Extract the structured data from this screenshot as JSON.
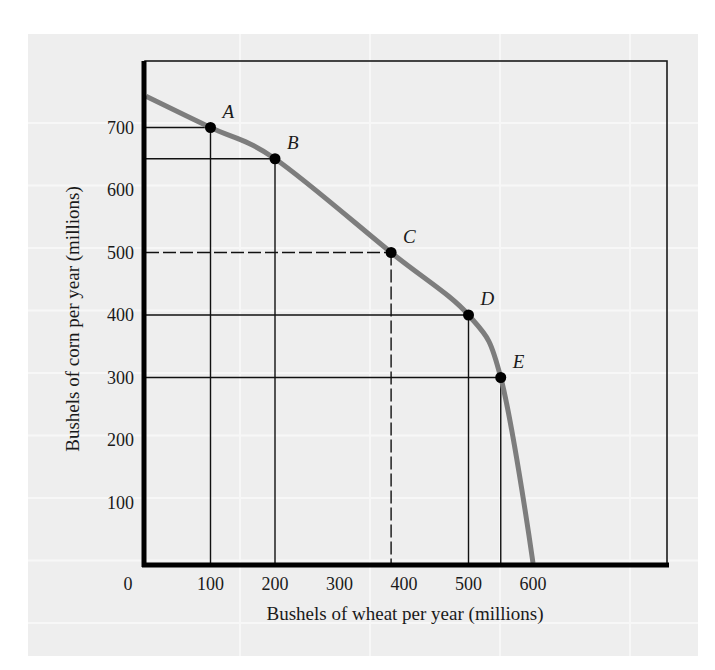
{
  "chart_data": {
    "type": "line",
    "title": "",
    "subtitle": "",
    "xlabel": "Bushels of wheat per year (millions)",
    "ylabel": "Bushels of corn per year (millions)",
    "xlim": [
      0,
      800
    ],
    "ylim": [
      0,
      800
    ],
    "grid": false,
    "legend": null,
    "x_ticks": [
      0,
      100,
      200,
      300,
      400,
      500,
      600
    ],
    "y_ticks": [
      100,
      200,
      300,
      400,
      500,
      600,
      700
    ],
    "series": [
      {
        "name": "Production possibility frontier",
        "x": [
          0,
          100,
          200,
          380,
          500,
          550,
          600
        ],
        "y": [
          750,
          700,
          650,
          500,
          400,
          300,
          0
        ]
      }
    ],
    "points": [
      {
        "label": "A",
        "x": 100,
        "y": 700,
        "guide": "solid"
      },
      {
        "label": "B",
        "x": 200,
        "y": 650,
        "guide": "solid"
      },
      {
        "label": "C",
        "x": 380,
        "y": 500,
        "guide": "dashed"
      },
      {
        "label": "D",
        "x": 500,
        "y": 400,
        "guide": "solid"
      },
      {
        "label": "E",
        "x": 550,
        "y": 300,
        "guide": "solid"
      }
    ],
    "colors": {
      "curve": "#7d7d7d",
      "axis": "#000000",
      "point": "#000000",
      "panel_bg": "#eeeeee",
      "panel_grid": "#f7f7f7"
    }
  }
}
